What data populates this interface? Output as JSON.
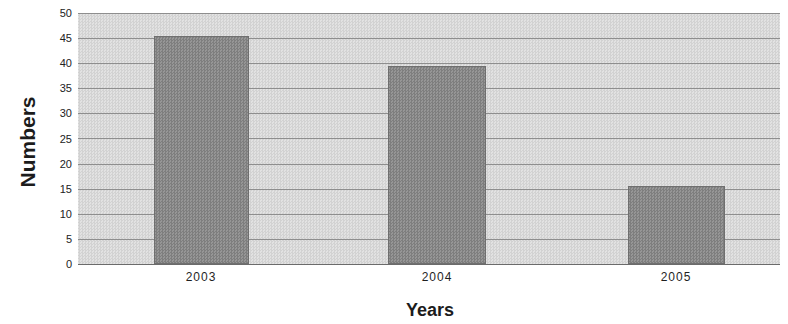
{
  "chart_data": {
    "type": "bar",
    "title": "",
    "xlabel": "Years",
    "ylabel": "Numbers",
    "categories": [
      "2003",
      "2004",
      "2005"
    ],
    "values": [
      45.5,
      39.5,
      15.5
    ],
    "series": [
      {
        "name": "Numbers",
        "values": [
          45.5,
          39.5,
          15.5
        ]
      }
    ],
    "ylim": [
      0,
      50
    ],
    "ytick_labels": [
      "50",
      "45",
      "40",
      "35",
      "30",
      "25",
      "20",
      "15",
      "10",
      "5",
      "0"
    ],
    "ytick_values": [
      50,
      45,
      40,
      35,
      30,
      25,
      20,
      15,
      10,
      5,
      0
    ],
    "ytick_step": 5,
    "grid": true,
    "grid_axis": "y",
    "legend": false,
    "legend_position": "none",
    "colors": {
      "bar_fill": "#8a8a8a",
      "bar_border": "#6f6f6f",
      "plot_background": "#dcdcdc",
      "gridline": "#8e8e8e",
      "axis_line": "#6b6b6b",
      "text": "#1c1c1c",
      "page_background": "#ffffff"
    }
  }
}
